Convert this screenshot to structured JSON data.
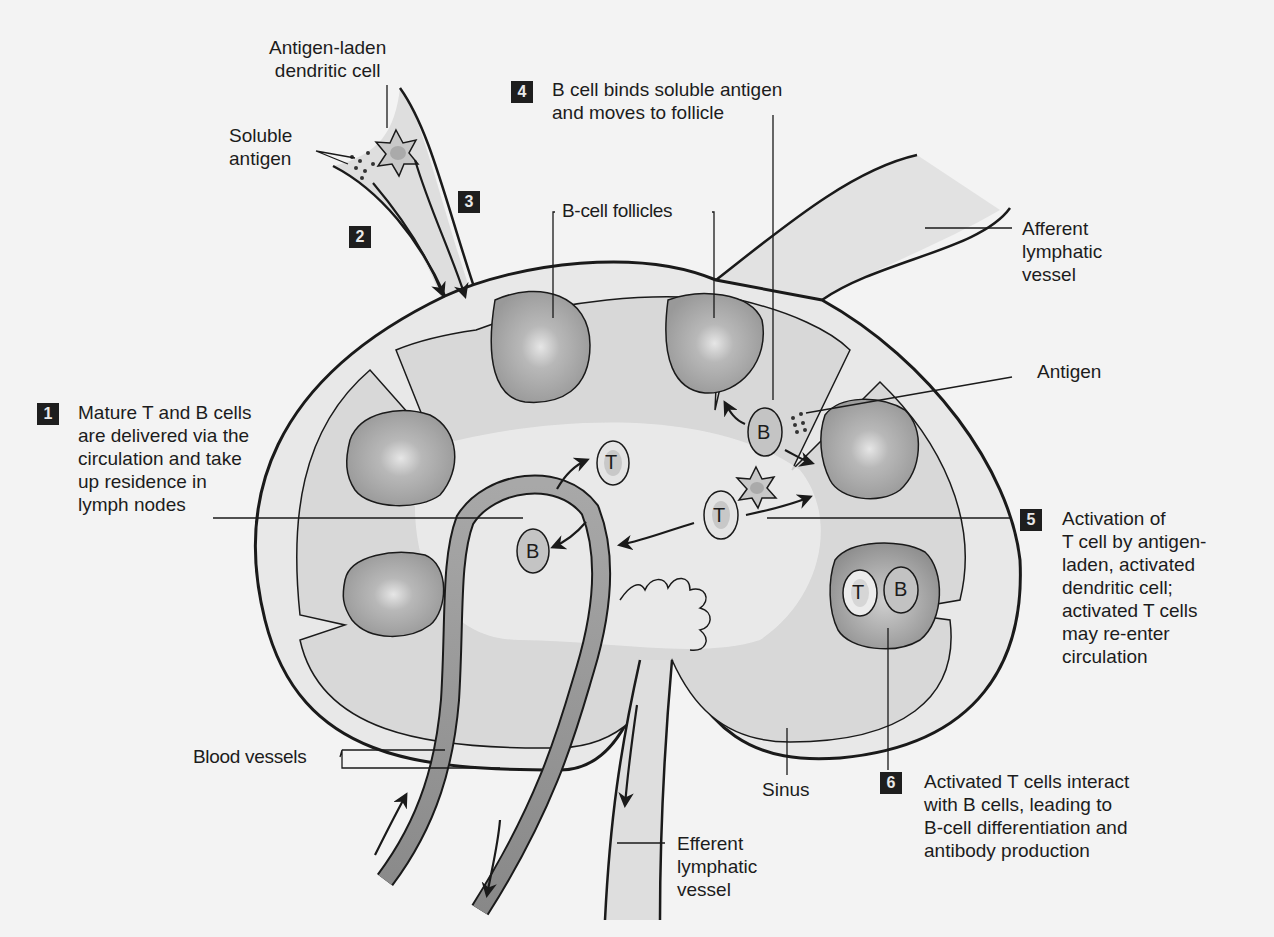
{
  "figure": {
    "colors": {
      "background": "#f3f3f3",
      "capsule_fill": "#e6e6e6",
      "cortex_fill": "#d6d6d6",
      "follicle_fill": "#9e9e9e",
      "follicle_highlight": "#dcdcdc",
      "blood_vessel": "#9a9a9a",
      "lymphatic_fill": "#dedede",
      "outline": "#1a1a1a",
      "step_badge": "#1e1e1e"
    }
  },
  "labels": {
    "antigen_laden_dendritic_cell": [
      "Antigen-laden",
      "dendritic cell"
    ],
    "soluble_antigen": [
      "Soluble",
      "antigen"
    ],
    "b_cell_follicles": "B-cell follicles",
    "afferent_lymphatic_vessel": [
      "Afferent",
      "lymphatic",
      "vessel"
    ],
    "antigen": "Antigen",
    "blood_vessels": "Blood vessels",
    "sinus": "Sinus",
    "efferent_lymphatic_vessel": [
      "Efferent",
      "lymphatic",
      "vessel"
    ]
  },
  "cell_letters": {
    "t": "T",
    "b": "B"
  },
  "steps": [
    {
      "num": "1",
      "lines": [
        "Mature T and B cells",
        "are delivered via the",
        "circulation and take",
        "up residence in",
        "lymph nodes"
      ]
    },
    {
      "num": "2",
      "lines": []
    },
    {
      "num": "3",
      "lines": []
    },
    {
      "num": "4",
      "lines": [
        "B cell binds soluble antigen",
        "and moves to follicle"
      ]
    },
    {
      "num": "5",
      "lines": [
        "Activation of",
        "T cell by antigen-",
        "laden, activated",
        "dendritic cell;",
        "activated T cells",
        "may re-enter",
        "circulation"
      ]
    },
    {
      "num": "6",
      "lines": [
        "Activated T cells interact",
        "with B cells, leading to",
        "B-cell differentiation and",
        "antibody production"
      ]
    }
  ]
}
